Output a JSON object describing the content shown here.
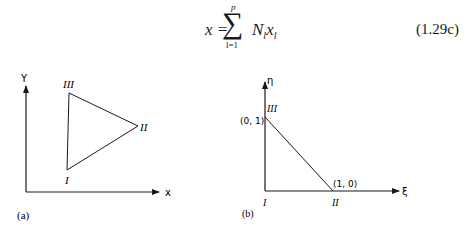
{
  "equation": {
    "lhs": "x =",
    "operator": "∑",
    "upper_limit": "p",
    "lower_limit": "l=1",
    "rhs": "N",
    "rhs_sub1": "l",
    "rhs_var": "x",
    "rhs_sub2": "l",
    "number": "(1.29c)"
  },
  "figure_a": {
    "caption": "(a)",
    "y_axis_label": "Y",
    "x_axis_label": "x",
    "vertices": [
      {
        "label": "I",
        "x": 67,
        "y": 170
      },
      {
        "label": "II",
        "x": 138,
        "y": 126
      },
      {
        "label": "III",
        "x": 69,
        "y": 93
      }
    ]
  },
  "figure_b": {
    "caption": "(b)",
    "y_axis_label": "η",
    "x_axis_label": "ξ",
    "vertices": [
      {
        "label": "I",
        "coord": ""
      },
      {
        "label": "II",
        "coord": "(1, 0)"
      },
      {
        "label": "III",
        "coord": "(0, 1)"
      }
    ]
  }
}
